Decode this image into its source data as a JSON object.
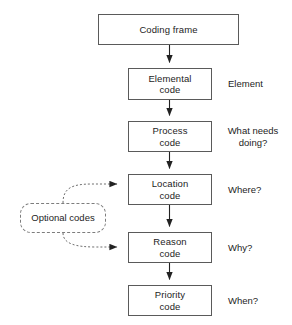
{
  "diagram": {
    "type": "flowchart",
    "colors": {
      "box_border": "#5a5a5a",
      "dashed_border": "#7d7d7d",
      "connector": "#222222",
      "text": "#1d1d1d",
      "background": "#ffffff"
    },
    "nodes": [
      {
        "id": "coding-frame",
        "label": "Coding frame",
        "shape": "rect",
        "x": 98,
        "y": 14,
        "w": 141,
        "h": 31
      },
      {
        "id": "elemental-code",
        "label": "Elemental\ncode",
        "shape": "rect",
        "x": 128,
        "y": 68,
        "w": 84,
        "h": 32
      },
      {
        "id": "process-code",
        "label": "Process\ncode",
        "shape": "rect",
        "x": 128,
        "y": 121,
        "w": 84,
        "h": 31
      },
      {
        "id": "location-code",
        "label": "Location\ncode",
        "shape": "rect",
        "x": 128,
        "y": 174,
        "w": 84,
        "h": 31
      },
      {
        "id": "reason-code",
        "label": "Reason\ncode",
        "shape": "rect",
        "x": 128,
        "y": 232,
        "w": 84,
        "h": 31
      },
      {
        "id": "priority-code",
        "label": "Priority\ncode",
        "shape": "rect",
        "x": 128,
        "y": 285,
        "w": 84,
        "h": 31
      },
      {
        "id": "optional-codes",
        "label": "Optional codes",
        "shape": "rounded-dashed",
        "x": 20,
        "y": 203,
        "w": 86,
        "h": 30
      }
    ],
    "side_labels": [
      {
        "id": "element-label",
        "text": "Element",
        "for": "elemental-code",
        "x": 228,
        "y": 78
      },
      {
        "id": "process-label",
        "text": "What needs\ndoing?",
        "for": "process-code",
        "x": 224,
        "y": 125
      },
      {
        "id": "location-label",
        "text": "Where?",
        "for": "location-code",
        "x": 228,
        "y": 184
      },
      {
        "id": "reason-label",
        "text": "Why?",
        "for": "reason-code",
        "x": 228,
        "y": 242
      },
      {
        "id": "priority-label",
        "text": "When?",
        "for": "priority-code",
        "x": 228,
        "y": 295
      }
    ],
    "connectors": [
      {
        "from": "coding-frame",
        "to": "elemental-code",
        "style": "solid",
        "arrow": "filled-triangle"
      },
      {
        "from": "elemental-code",
        "to": "process-code",
        "style": "solid",
        "arrow": "filled-triangle"
      },
      {
        "from": "process-code",
        "to": "location-code",
        "style": "solid",
        "arrow": "filled-triangle"
      },
      {
        "from": "location-code",
        "to": "reason-code",
        "style": "solid",
        "arrow": "filled-triangle"
      },
      {
        "from": "reason-code",
        "to": "priority-code",
        "style": "solid",
        "arrow": "filled-triangle"
      },
      {
        "from": "optional-codes",
        "to": "location-code",
        "style": "dashed",
        "arrow": "filled-triangle"
      },
      {
        "from": "optional-codes",
        "to": "reason-code",
        "style": "dashed",
        "arrow": "filled-triangle"
      }
    ]
  }
}
